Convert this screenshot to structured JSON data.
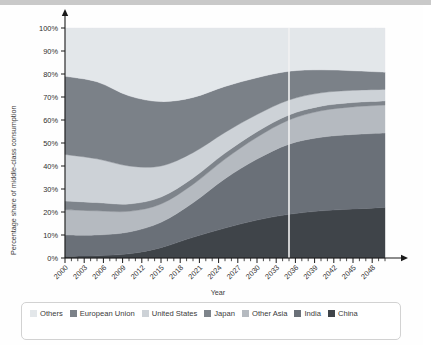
{
  "chart_data": {
    "type": "area",
    "stacked": true,
    "title": "",
    "xlabel": "Year",
    "ylabel": "Percentage share of middle-class consumption",
    "xlim": [
      2000,
      2050
    ],
    "ylim": [
      0,
      100
    ],
    "grid": false,
    "legend_position": "bottom",
    "x_tick_labels": [
      "2000",
      "2003",
      "2006",
      "2009",
      "2012",
      "2015",
      "2018",
      "2021",
      "2024",
      "2027",
      "2030",
      "2033",
      "2036",
      "2039",
      "2042",
      "2045",
      "2048"
    ],
    "x_tick_values": [
      2000,
      2003,
      2006,
      2009,
      2012,
      2015,
      2018,
      2021,
      2024,
      2027,
      2030,
      2033,
      2036,
      2039,
      2042,
      2045,
      2048
    ],
    "x_minor_tick_step": 1,
    "y_tick_labels": [
      "0%",
      "10%",
      "20%",
      "30%",
      "40%",
      "50%",
      "60%",
      "70%",
      "80%",
      "90%",
      "100%"
    ],
    "y_tick_values": [
      0,
      10,
      20,
      30,
      40,
      50,
      60,
      70,
      80,
      90,
      100
    ],
    "annotations": [
      {
        "type": "vertical-line",
        "x": 2035,
        "color": "#f2f2f2",
        "label": ""
      }
    ],
    "x": [
      2000,
      2005,
      2010,
      2015,
      2020,
      2025,
      2030,
      2035,
      2040,
      2045,
      2050
    ],
    "series": [
      {
        "name": "China",
        "color": "#3f4449",
        "values": [
          0.8,
          1.0,
          1.8,
          4.5,
          9.0,
          13.0,
          16.5,
          19.0,
          20.5,
          21.3,
          22.0
        ]
      },
      {
        "name": "India",
        "color": "#6a7078",
        "values": [
          9.2,
          9.0,
          9.5,
          11.0,
          15.0,
          21.5,
          26.5,
          30.5,
          32.0,
          32.4,
          32.3
        ]
      },
      {
        "name": "Other Asia",
        "color": "#b5bac0",
        "values": [
          11.0,
          10.5,
          9.0,
          8.0,
          8.0,
          8.5,
          9.5,
          10.5,
          11.5,
          12.0,
          12.2
        ]
      },
      {
        "name": "Japan",
        "color": "#7e848b",
        "values": [
          3.8,
          3.6,
          3.2,
          3.0,
          2.8,
          2.6,
          2.4,
          2.2,
          2.0,
          1.9,
          1.8
        ]
      },
      {
        "name": "United States",
        "color": "#cdd2d7",
        "values": [
          20.2,
          19.0,
          16.5,
          13.5,
          11.0,
          9.0,
          7.5,
          6.5,
          5.8,
          5.3,
          5.0
        ]
      },
      {
        "name": "European Union",
        "color": "#7b8188",
        "values": [
          34.0,
          33.5,
          30.5,
          28.0,
          24.0,
          20.0,
          16.0,
          12.5,
          10.0,
          8.5,
          7.5
        ]
      },
      {
        "name": "Others",
        "color": "#e3e7ea",
        "values": [
          21.0,
          23.4,
          29.5,
          32.0,
          30.2,
          25.4,
          21.6,
          18.8,
          18.2,
          18.6,
          19.2
        ]
      }
    ]
  },
  "legend": {
    "items": [
      {
        "label": "Others",
        "color": "#e3e7ea"
      },
      {
        "label": "European Union",
        "color": "#7b8188"
      },
      {
        "label": "United States",
        "color": "#cdd2d7"
      },
      {
        "label": "Japan",
        "color": "#7e848b"
      },
      {
        "label": "Other Asia",
        "color": "#b5bac0"
      },
      {
        "label": "India",
        "color": "#6a7078"
      },
      {
        "label": "China",
        "color": "#3f4449"
      }
    ]
  },
  "axis": {
    "x_title": "Year",
    "y_title": "Percentage share of middle-class consumption"
  },
  "colors": {
    "axis_line": "#1a1a1a",
    "tick_text": "#2f2f2f",
    "panel_background": "#ffffff",
    "legend_border": "#d2d2d2",
    "top_strip": "#c9c9c9",
    "marker_line": "#f2f2f2"
  }
}
